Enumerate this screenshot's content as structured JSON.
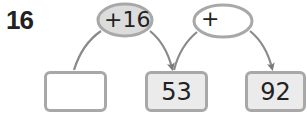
{
  "problem": {
    "number": "16"
  },
  "operations": [
    {
      "label": "+16",
      "fill": "#dcdcdc",
      "input_value": ""
    },
    {
      "label": "+",
      "fill": "#ffffff",
      "input_value": ""
    }
  ],
  "boxes": [
    {
      "value": "",
      "fill": "#ffffff",
      "editable": true
    },
    {
      "value": "53",
      "fill": "#ebebeb",
      "editable": false
    },
    {
      "value": "92",
      "fill": "#ebebeb",
      "editable": false
    }
  ],
  "colors": {
    "outline": "#a8a8a8",
    "arrow": "#8a8a8a",
    "text": "#222222"
  }
}
